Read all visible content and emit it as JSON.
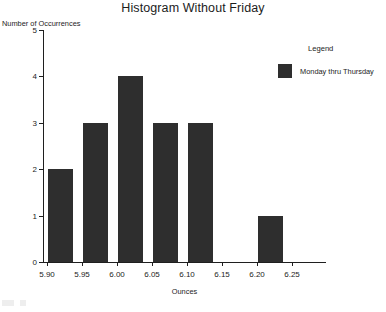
{
  "chart_data": {
    "type": "bar",
    "title": "Histogram Without Friday",
    "xlabel": "Ounces",
    "ylabel": "Number of Occurrences",
    "categories": [
      "5.90",
      "5.95",
      "6.00",
      "6.05",
      "6.10",
      "6.15",
      "6.20",
      "6.25"
    ],
    "values": [
      2,
      3,
      4,
      3,
      3,
      0,
      1,
      0
    ],
    "xlim": [
      5.9,
      6.25
    ],
    "ylim": [
      0,
      5
    ],
    "y_ticks": [
      "0",
      "1",
      "2",
      "3",
      "4",
      "5"
    ],
    "x_ticks": [
      "5.90",
      "5.95",
      "6.00",
      "6.05",
      "6.10",
      "6.15",
      "6.20",
      "6.25"
    ],
    "grid": false,
    "legend_position": "right",
    "series": [
      {
        "name": "Monday thru Thursday",
        "color": "#2e2e2e",
        "values": [
          2,
          3,
          4,
          3,
          3,
          0,
          1,
          0
        ]
      }
    ],
    "annotations": []
  },
  "legend": {
    "title": "Legend",
    "entries": [
      {
        "label": "Monday thru Thursday",
        "color": "#2e2e2e"
      }
    ]
  }
}
